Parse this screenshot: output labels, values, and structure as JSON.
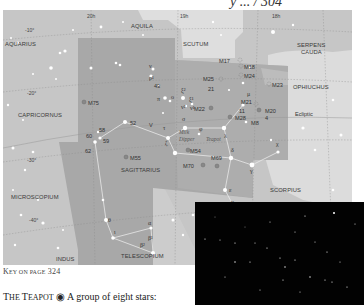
{
  "header": {
    "partial_title": "y ... / 304"
  },
  "chart": {
    "ra_labels": [
      "20h",
      "19h",
      "18h"
    ],
    "dec_labels": [
      "-10°",
      "-20°",
      "-30°",
      "-40°"
    ],
    "constellations": [
      "AQUILA",
      "AQUARIUS",
      "SCUTUM",
      "SERPENS",
      "CAUDA",
      "OPHIUCHUS",
      "CAPRICORNUS",
      "SAGITTARIUS",
      "MICROSCOPIUM",
      "SCORPIUS",
      "INDUS",
      "TELESCOPIUM"
    ],
    "messier": [
      "M17",
      "M18",
      "M24",
      "M25",
      "M23",
      "M21",
      "M20",
      "M22",
      "M28",
      "M8",
      "M75",
      "M55",
      "M54",
      "M70",
      "M69"
    ],
    "star_labels": [
      "ν",
      "ρ¹",
      "43",
      "π",
      "ο",
      "ξ²",
      "ξ¹",
      "ν²",
      "ν¹",
      "21",
      "μ",
      "11",
      "4",
      "σ",
      "λ",
      "τ",
      "φ",
      "ζ",
      "δ",
      "γ",
      "χ",
      "ε",
      "η",
      "52",
      "V",
      "60",
      "58",
      "59",
      "62",
      "θ",
      "ι",
      "α",
      "β¹",
      "β²"
    ],
    "annotations": {
      "ecliptic": "Ecliptic",
      "milk_dipper_1": "Milk",
      "milk_dipper_2": "Dipper",
      "teapot": "Teapot"
    },
    "colors": {
      "outer_sky": "#c9c9c9",
      "sagittarius": "#a9a9a9",
      "light_region": "#dcdcdc",
      "photo_bg": "#020202"
    }
  },
  "caption": {
    "key_prefix": "K",
    "key_rest": "EY ON PAGE",
    "page": "324"
  },
  "body": {
    "title_t": "T",
    "title_rest": "HE ",
    "title_t2": "T",
    "title_rest2": "EAPOT",
    "symbol": "◉",
    "text": " A group of eight stars:"
  }
}
